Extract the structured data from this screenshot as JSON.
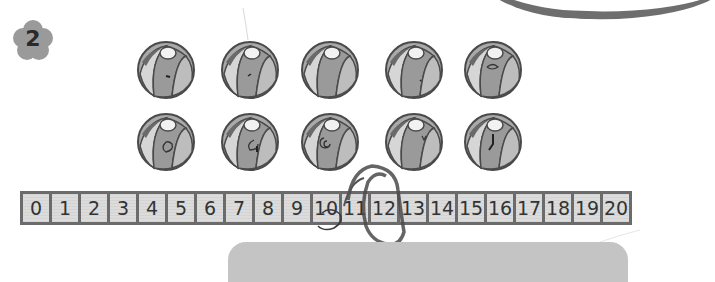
{
  "exercise": {
    "number": "2"
  },
  "balls": {
    "row1_count": 5,
    "row2_count": 5,
    "total": 10
  },
  "number_line": {
    "cells": [
      "0",
      "1",
      "2",
      "3",
      "4",
      "5",
      "6",
      "7",
      "8",
      "9",
      "10",
      "11",
      "12",
      "13",
      "14",
      "15",
      "16",
      "17",
      "18",
      "19",
      "20"
    ],
    "circled_answer": "12"
  },
  "colors": {
    "badge": "#9a9a9a",
    "frame": "#6b6b6b",
    "cell": "#dcdcdc",
    "scribble": "#3a3a3a"
  }
}
